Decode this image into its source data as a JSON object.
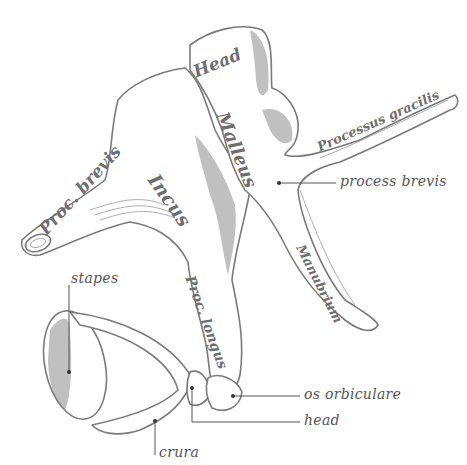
{
  "bones": {
    "malleus": {
      "label": "Malleus",
      "parts": {
        "head": "Head",
        "processus_gracilis": "Processus gracilis",
        "manubrium": "Manubrium"
      }
    },
    "incus": {
      "label": "Incus",
      "parts": {
        "proc_brevis": "Proc. brevis",
        "proc_longus": "Proc. longus"
      }
    },
    "stapes": {
      "label": "stapes"
    }
  },
  "callouts": [
    {
      "id": "process-brevis",
      "text": "process brevis"
    },
    {
      "id": "stapes",
      "text": "stapes"
    },
    {
      "id": "os-orbiculare",
      "text": "os orbiculare"
    },
    {
      "id": "head",
      "text": "head"
    },
    {
      "id": "crura",
      "text": "crura"
    }
  ],
  "colors": {
    "line": "#7a7a7a",
    "text": "#555555",
    "background": "#ffffff"
  }
}
